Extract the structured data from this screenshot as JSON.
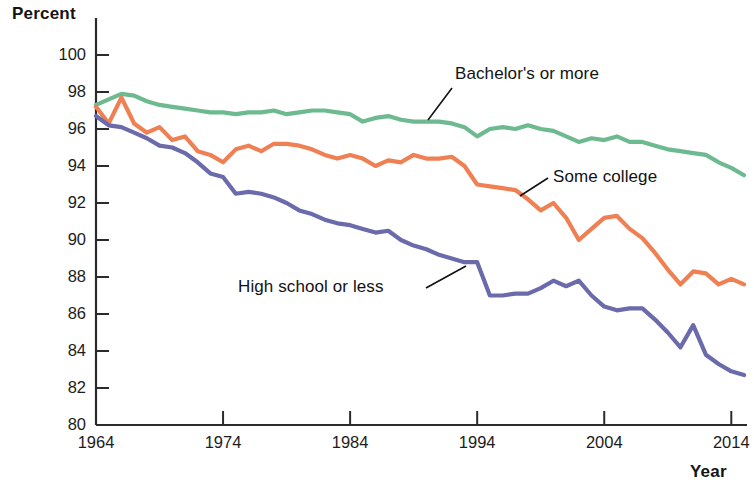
{
  "chart_data": {
    "type": "line",
    "title": "",
    "xlabel": "Year",
    "ylabel": "Percent",
    "xlim": [
      1964,
      2015
    ],
    "ylim": [
      80,
      100
    ],
    "grid": false,
    "legend_position": "inline-annotations",
    "x_ticks": [
      "1964",
      "1974",
      "1984",
      "1994",
      "2004",
      "2014"
    ],
    "x_tick_values": [
      1964,
      1974,
      1984,
      1994,
      2004,
      2014
    ],
    "y_ticks": [
      "80",
      "82",
      "84",
      "86",
      "88",
      "90",
      "92",
      "94",
      "96",
      "98",
      "100"
    ],
    "y_tick_values": [
      80,
      82,
      84,
      86,
      88,
      90,
      92,
      94,
      96,
      98,
      100
    ],
    "x": [
      1964,
      1965,
      1966,
      1967,
      1968,
      1969,
      1970,
      1971,
      1972,
      1973,
      1974,
      1975,
      1976,
      1977,
      1978,
      1979,
      1980,
      1981,
      1982,
      1983,
      1984,
      1985,
      1986,
      1987,
      1988,
      1989,
      1990,
      1991,
      1992,
      1993,
      1994,
      1995,
      1996,
      1997,
      1998,
      1999,
      2000,
      2001,
      2002,
      2003,
      2004,
      2005,
      2006,
      2007,
      2008,
      2009,
      2010,
      2011,
      2012,
      2013,
      2014,
      2015
    ],
    "series": [
      {
        "name": "Bachelor's or more",
        "color": "#6dba90",
        "values": [
          97.3,
          97.6,
          97.9,
          97.8,
          97.5,
          97.3,
          97.2,
          97.1,
          97.0,
          96.9,
          96.9,
          96.8,
          96.9,
          96.9,
          97.0,
          96.8,
          96.9,
          97.0,
          97.0,
          96.9,
          96.8,
          96.4,
          96.6,
          96.7,
          96.5,
          96.4,
          96.4,
          96.4,
          96.3,
          96.1,
          95.6,
          96.0,
          96.1,
          96.0,
          96.2,
          96.0,
          95.9,
          95.6,
          95.3,
          95.5,
          95.4,
          95.6,
          95.3,
          95.3,
          95.1,
          94.9,
          94.8,
          94.7,
          94.6,
          94.2,
          93.9,
          93.5
        ]
      },
      {
        "name": "Some college",
        "color": "#ef8054",
        "values": [
          97.2,
          96.3,
          97.7,
          96.3,
          95.8,
          96.1,
          95.4,
          95.6,
          94.8,
          94.6,
          94.2,
          94.9,
          95.1,
          94.8,
          95.2,
          95.2,
          95.1,
          94.9,
          94.6,
          94.4,
          94.6,
          94.4,
          94.0,
          94.3,
          94.2,
          94.6,
          94.4,
          94.4,
          94.5,
          94.0,
          93.0,
          92.9,
          92.8,
          92.7,
          92.2,
          91.6,
          92.0,
          91.2,
          90.0,
          90.6,
          91.2,
          91.3,
          90.6,
          90.1,
          89.3,
          88.4,
          87.6,
          88.3,
          88.2,
          87.6,
          87.9,
          87.6
        ]
      },
      {
        "name": "High school or less",
        "color": "#6b6bab",
        "values": [
          96.7,
          96.2,
          96.1,
          95.8,
          95.5,
          95.1,
          95.0,
          94.7,
          94.2,
          93.6,
          93.4,
          92.5,
          92.6,
          92.5,
          92.3,
          92.0,
          91.6,
          91.4,
          91.1,
          90.9,
          90.8,
          90.6,
          90.4,
          90.5,
          90.0,
          89.7,
          89.5,
          89.2,
          89.0,
          88.8,
          88.8,
          87.0,
          87.0,
          87.1,
          87.1,
          87.4,
          87.8,
          87.5,
          87.8,
          87.0,
          86.4,
          86.2,
          86.3,
          86.3,
          85.7,
          85.0,
          84.2,
          85.4,
          83.8,
          83.3,
          82.9,
          82.7
        ]
      }
    ],
    "annotations": [
      {
        "text": "Bachelor's or more",
        "target_series": "Bachelor's or more",
        "leader": "down-left"
      },
      {
        "text": "Some college",
        "target_series": "Some college",
        "leader": "left-down"
      },
      {
        "text": "High school or less",
        "target_series": "High school or less",
        "leader": "up-right"
      }
    ]
  },
  "axes": {
    "y_title": "Percent",
    "x_title": "Year"
  }
}
